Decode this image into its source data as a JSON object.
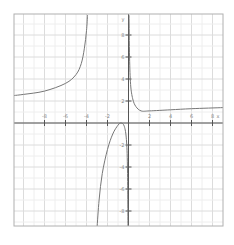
{
  "chart_data": {
    "type": "line",
    "title": "",
    "xlabel": "x",
    "ylabel": "y",
    "xlim": [
      -10.9,
      9.0
    ],
    "ylim": [
      -9.6,
      9.8
    ],
    "grid": true,
    "x_ticks": [
      -8,
      -6,
      -4,
      -2,
      2,
      4,
      6,
      8
    ],
    "y_ticks": [
      8,
      6,
      4,
      2,
      -2,
      -4,
      -6,
      -8
    ],
    "vertical_asymptotes": [
      -3.5,
      0
    ],
    "horizontal_asymptote_approx": 1.5,
    "series": [
      {
        "name": "left branch",
        "points": [
          [
            -10.9,
            2.5
          ],
          [
            -10,
            2.6
          ],
          [
            -8,
            2.9
          ],
          [
            -6,
            3.6
          ],
          [
            -5,
            4.4
          ],
          [
            -4.5,
            5.4
          ],
          [
            -4.2,
            6.8
          ],
          [
            -4.0,
            8.4
          ],
          [
            -3.9,
            9.8
          ]
        ]
      },
      {
        "name": "middle branch",
        "points": [
          [
            -3.0,
            -9.6
          ],
          [
            -2.8,
            -7.0
          ],
          [
            -2.5,
            -4.6
          ],
          [
            -2.0,
            -2.4
          ],
          [
            -1.5,
            -1.0
          ],
          [
            -1.0,
            -0.2
          ],
          [
            -0.7,
            0.0
          ],
          [
            -0.4,
            -0.3
          ],
          [
            -0.2,
            -1.5
          ],
          [
            -0.1,
            -4.0
          ],
          [
            -0.05,
            -9.6
          ]
        ]
      },
      {
        "name": "right branch",
        "points": [
          [
            0.05,
            9.8
          ],
          [
            0.1,
            6.0
          ],
          [
            0.2,
            3.5
          ],
          [
            0.4,
            2.2
          ],
          [
            0.7,
            1.5
          ],
          [
            1.2,
            1.1
          ],
          [
            2,
            1.1
          ],
          [
            4,
            1.2
          ],
          [
            6,
            1.3
          ],
          [
            9.0,
            1.4
          ]
        ]
      }
    ]
  },
  "colors": {
    "frame": "#b0b0b0",
    "grid_minor": "#eeeeee",
    "grid_major": "#dcdcdc",
    "axis": "#555555",
    "curve": "#777777",
    "tick_label": "#888888"
  },
  "layout": {
    "frame": {
      "left": 14,
      "top": 14,
      "right": 223,
      "bottom": 226
    },
    "origin_px": {
      "x": 128.5,
      "y": 123
    },
    "px_per_unit_x": 10.5,
    "px_per_unit_y": 11
  }
}
